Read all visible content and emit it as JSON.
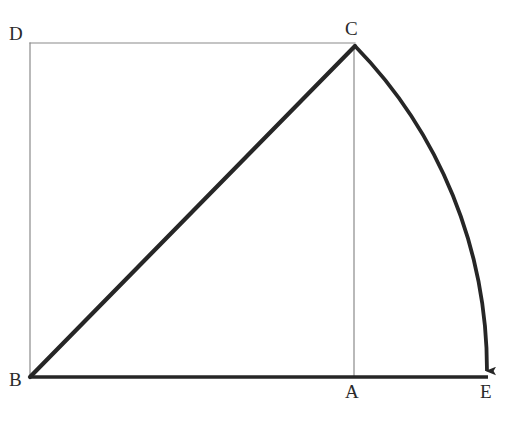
{
  "figure": {
    "canvas": {
      "width": 509,
      "height": 421,
      "background": "#ffffff"
    },
    "labels": {
      "D": "D",
      "C": "C",
      "B": "B",
      "A": "A",
      "E": "E"
    },
    "points": {
      "D": {
        "x": 30,
        "y": 43,
        "label": "D"
      },
      "C": {
        "x": 355,
        "y": 45,
        "label": "C"
      },
      "B": {
        "x": 30,
        "y": 377,
        "label": "B"
      },
      "A": {
        "x": 354,
        "y": 377,
        "label": "A"
      },
      "E": {
        "x": 487,
        "y": 377,
        "label": "E"
      }
    },
    "strokes": {
      "thick_color": "#262626",
      "thin_color": "#8a8a8a",
      "thick_width": 4,
      "medium_width": 3,
      "thin_width": 1.2
    },
    "segments": [
      {
        "name": "edge-DC",
        "from": "D",
        "to": "C",
        "weight": "thin",
        "description": "top edge of rectangle from D to C"
      },
      {
        "name": "edge-DB",
        "from": "D",
        "to": "B",
        "weight": "thin",
        "description": "left edge of rectangle from D to B"
      },
      {
        "name": "segment-CA",
        "from": "C",
        "to": "A",
        "weight": "thin",
        "description": "vertical drop from C to A"
      },
      {
        "name": "hypotenuse-BC",
        "from": "B",
        "to": "C",
        "weight": "thick",
        "description": "diagonal from B up to C"
      },
      {
        "name": "baseline-BE",
        "from": "B",
        "to": "E",
        "weight": "medium",
        "description": "horizontal base from B through A to E"
      }
    ],
    "arc": {
      "name": "arc-CE",
      "from": "C",
      "to": "E",
      "center": "B",
      "radius": 464,
      "sweep": "clockwise",
      "arrowhead": {
        "at": "E",
        "direction": "down"
      },
      "description": "circular arc centered at B swinging C down to E on the baseline"
    }
  }
}
